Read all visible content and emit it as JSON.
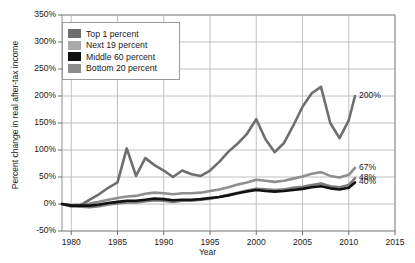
{
  "chart_data": {
    "type": "line",
    "title": "",
    "xlabel": "Year",
    "ylabel": "Percent change in real after-tax income",
    "xlim": [
      1979,
      2015
    ],
    "ylim": [
      -50,
      350
    ],
    "xticks": [
      "1980",
      "1985",
      "1990",
      "1995",
      "2000",
      "2005",
      "2010",
      "2015"
    ],
    "xtick_values": [
      1980,
      1985,
      1990,
      1995,
      2000,
      2005,
      2010,
      2015
    ],
    "yticks": [
      "-50%",
      "0%",
      "50%",
      "100%",
      "150%",
      "200%",
      "250%",
      "300%",
      "350%"
    ],
    "ytick_values": [
      -50,
      0,
      50,
      100,
      150,
      200,
      250,
      300,
      350
    ],
    "grid": true,
    "legend_position": "top-left",
    "x": [
      1979,
      1980,
      1981,
      1982,
      1983,
      1984,
      1985,
      1986,
      1987,
      1988,
      1989,
      1990,
      1991,
      1992,
      1993,
      1994,
      1995,
      1996,
      1997,
      1998,
      1999,
      2000,
      2001,
      2002,
      2003,
      2004,
      2005,
      2006,
      2007,
      2008,
      2009,
      2010
    ],
    "series": [
      {
        "name": "Top 1 percent",
        "color": "#6e6e6e",
        "end_label": "200%",
        "values": [
          0,
          -4,
          -2,
          8,
          18,
          30,
          40,
          103,
          52,
          85,
          72,
          62,
          50,
          62,
          55,
          52,
          62,
          78,
          97,
          112,
          130,
          157,
          120,
          96,
          113,
          145,
          180,
          205,
          217,
          150,
          122,
          155
        ]
      },
      {
        "name": "Next 19 percent",
        "color": "#8e8e8e",
        "end_label": "67%",
        "values": [
          0,
          -2,
          -1,
          1,
          4,
          8,
          11,
          14,
          15,
          19,
          21,
          20,
          18,
          20,
          20,
          21,
          24,
          27,
          31,
          36,
          40,
          45,
          43,
          41,
          43,
          47,
          51,
          56,
          59,
          52,
          49,
          54
        ]
      },
      {
        "name": "Middle 60 percent",
        "color": "#111111",
        "end_label": "40%",
        "values": [
          0,
          -3,
          -3,
          -3,
          -1,
          2,
          4,
          6,
          6,
          8,
          10,
          9,
          7,
          8,
          8,
          9,
          11,
          13,
          16,
          20,
          23,
          26,
          24,
          23,
          24,
          26,
          28,
          31,
          33,
          29,
          27,
          30
        ]
      },
      {
        "name": "Bottom 20 percent",
        "color": "#7c7c7c",
        "end_label": "48%",
        "values": [
          0,
          -4,
          -5,
          -6,
          -4,
          -1,
          1,
          3,
          3,
          5,
          7,
          6,
          4,
          6,
          6,
          8,
          10,
          13,
          17,
          21,
          25,
          28,
          27,
          26,
          27,
          30,
          32,
          35,
          38,
          33,
          31,
          35
        ]
      }
    ]
  },
  "legend": {
    "items": [
      {
        "label": "Top 1 percent",
        "color": "#6e6e6e"
      },
      {
        "label": "Next 19 percent",
        "color": "#a9a9a9"
      },
      {
        "label": "Middle 60 percent",
        "color": "#111111"
      },
      {
        "label": "Bottom 20 percent",
        "color": "#8c8c8c"
      }
    ]
  },
  "end_labels": [
    {
      "text": "200%",
      "value": 200
    },
    {
      "text": "67%",
      "value": 67
    },
    {
      "text": "48%",
      "value": 48
    },
    {
      "text": "40%",
      "value": 40
    }
  ]
}
